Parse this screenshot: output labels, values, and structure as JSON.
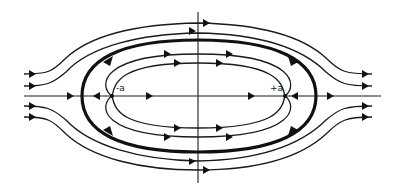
{
  "diagram": {
    "labels": {
      "minus_a": "-a",
      "plus_a": "+a"
    },
    "colors": {
      "ink": "#111111",
      "background": "#ffffff"
    },
    "elements": {
      "axes": [
        "horizontal-axis",
        "vertical-axis"
      ],
      "stagnation_points": [
        {
          "label": "-a",
          "x": 112,
          "y": 96
        },
        {
          "label": "+a",
          "x": 285,
          "y": 96
        }
      ],
      "dividing_streamline": "thick oval (Rankine body)",
      "outer_streamlines": 4,
      "inner_closed_streamlines": 4
    }
  }
}
